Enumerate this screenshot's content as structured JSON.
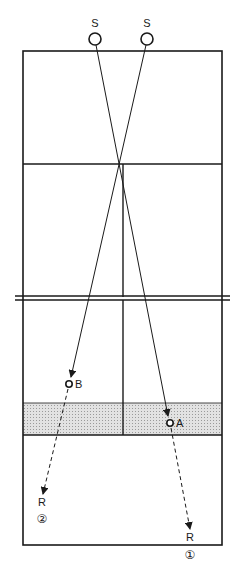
{
  "diagram": {
    "colors": {
      "line": "#1a1a1a",
      "shade": "#d4d4d4",
      "background": "#ffffff"
    },
    "labels": {
      "server_left": "S",
      "server_right": "S",
      "point_b": "B",
      "point_a": "A",
      "receiver_2": "R",
      "receiver_2_num": "②",
      "receiver_1": "R",
      "receiver_1_num": "①"
    }
  }
}
